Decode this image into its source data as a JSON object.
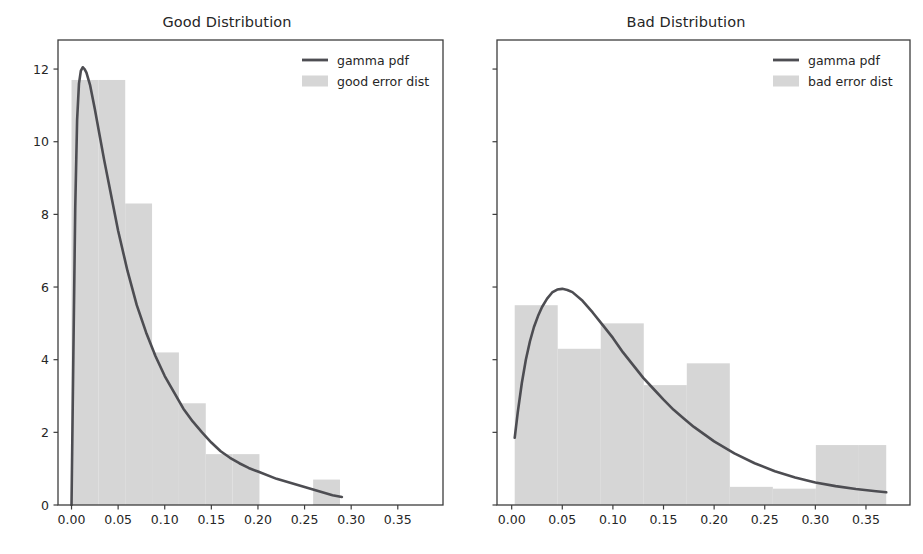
{
  "figure": {
    "background": "#ffffff",
    "width": 923,
    "height": 554,
    "panel_count": 2
  },
  "style": {
    "line_color": "#4d4d52",
    "hist_color": "#d6d6d6",
    "axis_color": "#3d3d3d",
    "text_color": "#262626",
    "tick_label_size": "12.5px",
    "legend_label_size": "12.5px",
    "title_size": "14.5px"
  },
  "panels": [
    {
      "id": "good",
      "title": "Good Distribution",
      "y_axis_labels_visible": true,
      "legend": {
        "position": "upper right",
        "entries": [
          {
            "label": "gamma pdf",
            "marker": "line",
            "color": "#4d4d52"
          },
          {
            "label": "good error dist",
            "marker": "patch",
            "color": "#d6d6d6"
          }
        ]
      }
    },
    {
      "id": "bad",
      "title": "Bad Distribution",
      "y_axis_labels_visible": false,
      "legend": {
        "position": "upper right",
        "entries": [
          {
            "label": "gamma pdf",
            "marker": "line",
            "color": "#4d4d52"
          },
          {
            "label": "bad error dist",
            "marker": "patch",
            "color": "#d6d6d6"
          }
        ]
      }
    }
  ],
  "chart_data": [
    {
      "type": "area",
      "id": "good-distribution",
      "title": "Good Distribution",
      "xlabel": "",
      "ylabel": "",
      "xlim": [
        -0.0145,
        0.3985
      ],
      "ylim": [
        0,
        12.8
      ],
      "grid": false,
      "legend_position": "upper right",
      "xticks": [
        0.0,
        0.05,
        0.1,
        0.15,
        0.2,
        0.25,
        0.3,
        0.35
      ],
      "xticklabels": [
        "0.00",
        "0.05",
        "0.10",
        "0.15",
        "0.20",
        "0.25",
        "0.30",
        "0.35"
      ],
      "yticks": [
        0,
        2,
        4,
        6,
        8,
        10,
        12
      ],
      "yticklabels": [
        "0",
        "2",
        "4",
        "6",
        "8",
        "10",
        "12"
      ],
      "series": [
        {
          "name": "good error dist",
          "type": "histogram",
          "color": "#d6d6d6",
          "bin_edges": [
            0.0,
            0.0288,
            0.0576,
            0.0864,
            0.1152,
            0.144,
            0.1728,
            0.2016,
            0.2304,
            0.2592,
            0.288
          ],
          "values": [
            11.7,
            11.7,
            8.3,
            4.2,
            2.8,
            1.4,
            1.4,
            0.0,
            0.0,
            0.7
          ]
        },
        {
          "name": "gamma pdf",
          "type": "line",
          "color": "#4d4d52",
          "linewidth": 2.6,
          "x": [
            0.0,
            0.002,
            0.004,
            0.006,
            0.008,
            0.01,
            0.012,
            0.014,
            0.016,
            0.02,
            0.025,
            0.03,
            0.035,
            0.04,
            0.05,
            0.06,
            0.07,
            0.08,
            0.09,
            0.1,
            0.11,
            0.12,
            0.13,
            0.14,
            0.15,
            0.16,
            0.17,
            0.18,
            0.19,
            0.2,
            0.22,
            0.24,
            0.26,
            0.28,
            0.29
          ],
          "y": [
            0.0,
            4.2,
            8.2,
            10.6,
            11.6,
            11.95,
            12.05,
            12.0,
            11.9,
            11.55,
            10.9,
            10.2,
            9.5,
            8.85,
            7.55,
            6.45,
            5.5,
            4.75,
            4.1,
            3.55,
            3.1,
            2.65,
            2.3,
            2.0,
            1.72,
            1.48,
            1.3,
            1.15,
            1.02,
            0.92,
            0.72,
            0.57,
            0.42,
            0.27,
            0.22
          ]
        }
      ]
    },
    {
      "type": "area",
      "id": "bad-distribution",
      "title": "Bad Distribution",
      "xlabel": "",
      "ylabel": "",
      "xlim": [
        -0.0145,
        0.3935
      ],
      "ylim": [
        0,
        12.8
      ],
      "grid": false,
      "legend_position": "upper right",
      "xticks": [
        0.0,
        0.05,
        0.1,
        0.15,
        0.2,
        0.25,
        0.3,
        0.35
      ],
      "xticklabels": [
        "0.00",
        "0.05",
        "0.10",
        "0.15",
        "0.20",
        "0.25",
        "0.30",
        "0.35"
      ],
      "yticks": [
        0,
        2,
        4,
        6,
        8,
        10,
        12
      ],
      "yticklabels": [
        "",
        "",
        "",
        "",
        "",
        "",
        ""
      ],
      "series": [
        {
          "name": "bad error dist",
          "type": "histogram",
          "color": "#d6d6d6",
          "bin_edges": [
            0.003,
            0.0455,
            0.088,
            0.1305,
            0.173,
            0.2155,
            0.258,
            0.3005,
            0.343,
            0.37
          ],
          "values": [
            5.5,
            4.3,
            5.0,
            3.3,
            3.9,
            0.5,
            0.45,
            1.65,
            1.65
          ]
        },
        {
          "name": "gamma pdf",
          "type": "line",
          "color": "#4d4d52",
          "linewidth": 2.6,
          "x": [
            0.003,
            0.006,
            0.01,
            0.014,
            0.018,
            0.022,
            0.026,
            0.03,
            0.035,
            0.04,
            0.045,
            0.05,
            0.055,
            0.06,
            0.07,
            0.08,
            0.09,
            0.1,
            0.11,
            0.12,
            0.13,
            0.14,
            0.15,
            0.16,
            0.17,
            0.18,
            0.19,
            0.2,
            0.22,
            0.24,
            0.26,
            0.28,
            0.3,
            0.32,
            0.34,
            0.36,
            0.37
          ],
          "y": [
            1.85,
            2.55,
            3.35,
            4.0,
            4.5,
            4.9,
            5.2,
            5.45,
            5.68,
            5.85,
            5.93,
            5.95,
            5.92,
            5.86,
            5.62,
            5.3,
            4.95,
            4.6,
            4.2,
            3.85,
            3.5,
            3.2,
            2.9,
            2.62,
            2.38,
            2.15,
            1.95,
            1.75,
            1.42,
            1.15,
            0.93,
            0.76,
            0.62,
            0.52,
            0.44,
            0.38,
            0.35
          ]
        }
      ]
    }
  ]
}
